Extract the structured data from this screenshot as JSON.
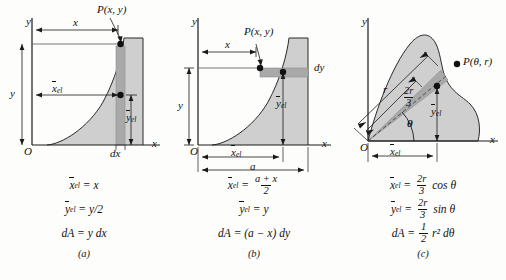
{
  "figure": {
    "type": "textbook-diagram",
    "background_color": "#fdfdfb",
    "fill_color": "#cfcfcf",
    "strip_color": "#b0b0b0",
    "line_color": "#1a1a1a"
  },
  "panels": [
    {
      "id": "a",
      "caption": "(a)",
      "element": "vertical strip",
      "axis_y_label": "y",
      "axis_x_label": "x",
      "origin_label": "O",
      "point_label": "P(x, y)",
      "dim_x_label": "x",
      "dim_y_label": "y",
      "dim_xel_label": "x",
      "dim_xel_sub": "el",
      "dim_yel_label": "y",
      "dim_yel_sub": "el",
      "strip_width_label": "dx",
      "equations": {
        "xel": {
          "lhs_sym": "x",
          "lhs_sub": "el",
          "rhs": "= x"
        },
        "yel": {
          "lhs_sym": "y",
          "lhs_sub": "el",
          "rhs": "= y/2"
        },
        "dA": {
          "lhs": "dA",
          "rhs": "= y dx"
        }
      }
    },
    {
      "id": "b",
      "caption": "(b)",
      "element": "horizontal strip",
      "axis_y_label": "y",
      "axis_x_label": "x",
      "origin_label": "O",
      "point_label": "P(x, y)",
      "dim_x_label": "x",
      "dim_y_label": "y",
      "dim_xel_label": "x",
      "dim_xel_sub": "el",
      "dim_yel_label": "y",
      "dim_yel_sub": "el",
      "dim_a_label": "a",
      "strip_height_label": "dy",
      "equations": {
        "xel": {
          "lhs_sym": "x",
          "lhs_sub": "el",
          "eq": "=",
          "num": "a + x",
          "den": "2"
        },
        "yel": {
          "lhs_sym": "y",
          "lhs_sub": "el",
          "rhs": "= y"
        },
        "dA": {
          "lhs": "dA",
          "rhs": "= (a − x) dy"
        }
      }
    },
    {
      "id": "c",
      "caption": "(c)",
      "element": "triangular sector",
      "axis_y_label": "y",
      "axis_x_label": "x",
      "origin_label": "O",
      "point_label": "P(θ, r)",
      "radius_label": "r",
      "two_r_over_three_num": "2r",
      "two_r_over_three_den": "3",
      "angle_label": "θ",
      "dim_xel_label": "x",
      "dim_xel_sub": "el",
      "dim_yel_label": "y",
      "dim_yel_sub": "el",
      "equations": {
        "xel": {
          "lhs_sym": "x",
          "lhs_sub": "el",
          "eq": "=",
          "num": "2r",
          "den": "3",
          "tail": "cos θ"
        },
        "yel": {
          "lhs_sym": "y",
          "lhs_sub": "el",
          "eq": "=",
          "num": "2r",
          "den": "3",
          "tail": "sin θ"
        },
        "dA": {
          "lhs": "dA",
          "eq": "=",
          "num": "1",
          "den": "2",
          "tail": "r² dθ"
        }
      }
    }
  ]
}
